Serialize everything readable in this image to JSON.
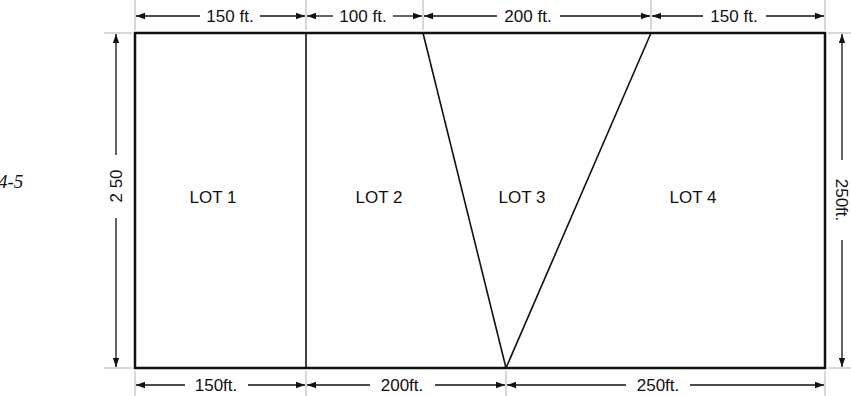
{
  "figure": {
    "label": "4-5"
  },
  "diagram": {
    "type": "lot-subdivision-plan",
    "lots": [
      {
        "label": "LOT 1",
        "shape": "rectangle"
      },
      {
        "label": "LOT 2",
        "shape": "trapezoid"
      },
      {
        "label": "LOT 3",
        "shape": "triangle"
      },
      {
        "label": "LOT 4",
        "shape": "trapezoid"
      }
    ],
    "top_dimensions": [
      "150 ft.",
      "100 ft.",
      "200 ft.",
      "150 ft."
    ],
    "bottom_dimensions": [
      "150ft.",
      "200ft.",
      "250ft."
    ],
    "left_dimension": "2 50",
    "right_dimension": "250ft.",
    "colors": {
      "line": "#111111",
      "background": "#ffffff"
    }
  }
}
